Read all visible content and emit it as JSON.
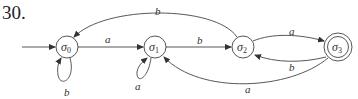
{
  "problem_number": "30.",
  "diagram": {
    "type": "finite-state-automaton",
    "start_state": "σ0",
    "accepting_states": [
      "σ3"
    ],
    "states": [
      {
        "id": "s0",
        "symbol": "σ",
        "subscript": "0",
        "x": 67,
        "y": 47,
        "accepting": false
      },
      {
        "id": "s1",
        "symbol": "σ",
        "subscript": "1",
        "x": 155,
        "y": 47,
        "accepting": false
      },
      {
        "id": "s2",
        "symbol": "σ",
        "subscript": "2",
        "x": 243,
        "y": 47,
        "accepting": false
      },
      {
        "id": "s3",
        "symbol": "σ",
        "subscript": "3",
        "x": 338,
        "y": 47,
        "accepting": true
      }
    ],
    "transitions": [
      {
        "from": "σ0",
        "to": "σ0",
        "label": "b"
      },
      {
        "from": "σ0",
        "to": "σ1",
        "label": "a"
      },
      {
        "from": "σ1",
        "to": "σ1",
        "label": "a"
      },
      {
        "from": "σ1",
        "to": "σ2",
        "label": "b"
      },
      {
        "from": "σ2",
        "to": "σ0",
        "label": "b"
      },
      {
        "from": "σ2",
        "to": "σ3",
        "label": "a"
      },
      {
        "from": "σ3",
        "to": "σ2",
        "label": "b"
      },
      {
        "from": "σ3",
        "to": "σ1",
        "label": "a"
      }
    ],
    "labels": {
      "loop_s0": "b",
      "s0_s1": "a",
      "loop_s1": "a",
      "s1_s2": "b",
      "s2_s0": "b",
      "s2_s3": "a",
      "s3_s2": "b",
      "s3_s1": "a"
    },
    "state_symbol": "σ",
    "subscripts": [
      "0",
      "1",
      "2",
      "3"
    ]
  }
}
